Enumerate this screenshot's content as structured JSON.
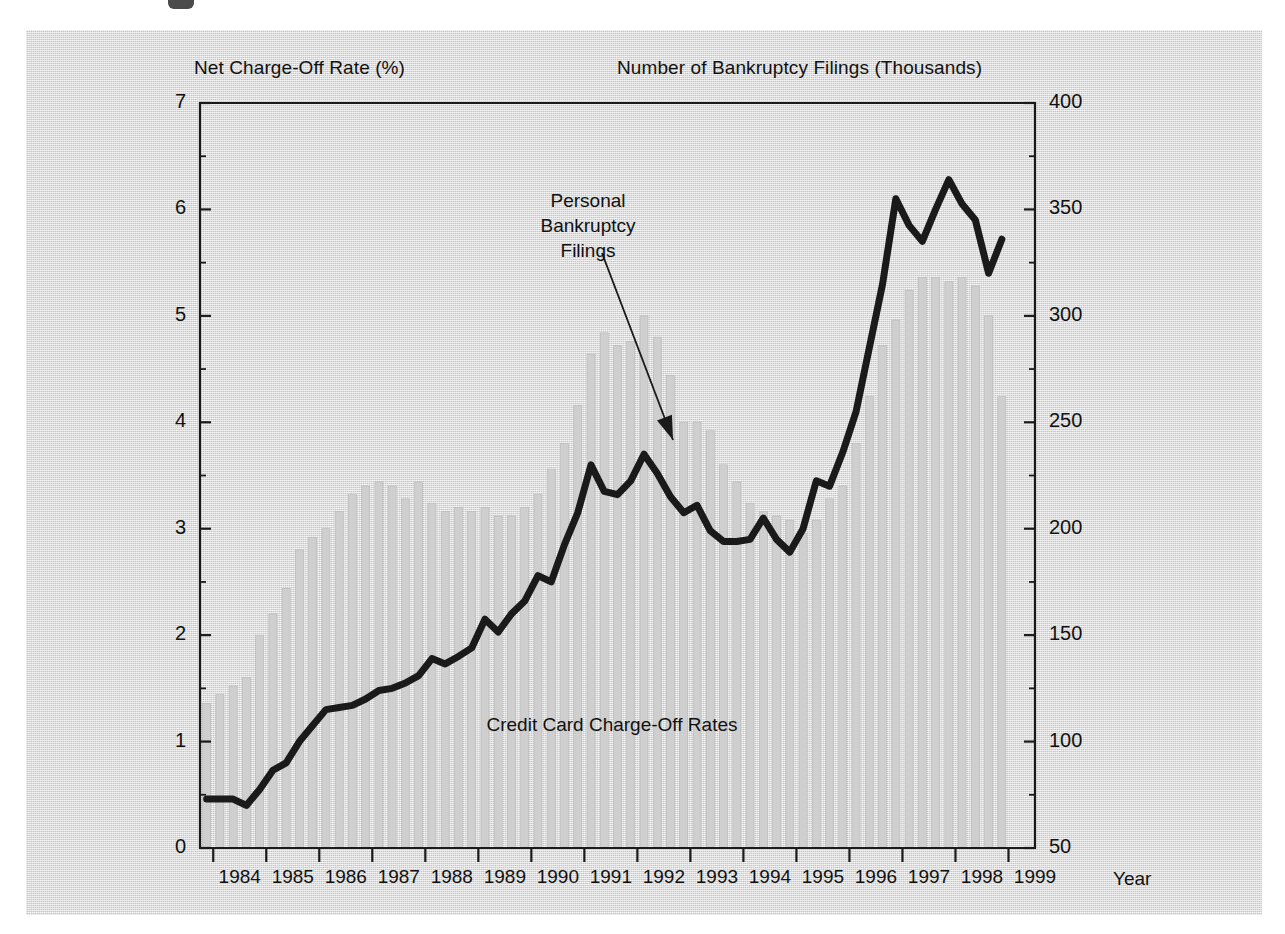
{
  "figure": {
    "background_color": "#d9d9d9",
    "left_axis_title": "Net Charge-Off Rate (%)",
    "right_axis_title": "Number of Bankruptcy Filings (Thousands)",
    "xaxis_name": "Year",
    "annotation_bankruptcy": "Personal\nBankruptcy\nFilings",
    "annotation_chargeoff": "Credit Card Charge-Off Rates",
    "line_color": "#1a1a1a",
    "bar_color": "#cfcfcf",
    "axis_color": "#1a1a1a"
  },
  "chart_data": {
    "type": "line",
    "title": "",
    "subtitle": "",
    "xlabel": "Year",
    "grid": false,
    "legend_position": "inline-annotations",
    "x_tick_labels": [
      "1984",
      "1985",
      "1986",
      "1987",
      "1988",
      "1989",
      "1990",
      "1991",
      "1992",
      "1993",
      "1994",
      "1995",
      "1996",
      "1997",
      "1998",
      "1999"
    ],
    "x_range": [
      1983.75,
      1999.5
    ],
    "axes": [
      {
        "id": "left",
        "label": "Net Charge-Off Rate (%)",
        "ylim": [
          0,
          7
        ],
        "major_ticks": [
          0,
          1,
          2,
          3,
          4,
          5,
          6,
          7
        ],
        "minor_tick_step": 0.5,
        "tick_labels": [
          "0",
          "1",
          "2",
          "3",
          "4",
          "5",
          "6",
          "7"
        ]
      },
      {
        "id": "right",
        "label": "Number of Bankruptcy Filings (Thousands)",
        "ylim": [
          50,
          400
        ],
        "major_ticks": [
          50,
          100,
          150,
          200,
          250,
          300,
          350,
          400
        ],
        "minor_tick_step": 25,
        "tick_labels": [
          "50",
          "100",
          "150",
          "200",
          "250",
          "300",
          "350",
          "400"
        ]
      }
    ],
    "series": [
      {
        "name": "Credit Card Charge-Off Rates",
        "axis": "left",
        "render": "line",
        "color": "#1a1a1a",
        "x": [
          1983.875,
          1984.125,
          1984.375,
          1984.625,
          1984.875,
          1985.125,
          1985.375,
          1985.625,
          1985.875,
          1986.125,
          1986.375,
          1986.625,
          1986.875,
          1987.125,
          1987.375,
          1987.625,
          1987.875,
          1988.125,
          1988.375,
          1988.625,
          1988.875,
          1989.125,
          1989.375,
          1989.625,
          1989.875,
          1990.125,
          1990.375,
          1990.625,
          1990.875,
          1991.125,
          1991.375,
          1991.625,
          1991.875,
          1992.125,
          1992.375,
          1992.625,
          1992.875,
          1993.125,
          1993.375,
          1993.625,
          1993.875,
          1994.125,
          1994.375,
          1994.625,
          1994.875,
          1995.125,
          1995.375,
          1995.625,
          1995.875,
          1996.125,
          1996.375,
          1996.625,
          1996.875,
          1997.125,
          1997.375,
          1997.625,
          1997.875,
          1998.125,
          1998.375,
          1998.625,
          1998.875
        ],
        "values": [
          0.46,
          0.46,
          0.46,
          0.4,
          0.55,
          0.73,
          0.8,
          1.0,
          1.15,
          1.3,
          1.32,
          1.34,
          1.4,
          1.48,
          1.5,
          1.55,
          1.62,
          1.78,
          1.73,
          1.8,
          1.88,
          2.15,
          2.03,
          2.2,
          2.32,
          2.56,
          2.5,
          2.85,
          3.15,
          3.6,
          3.35,
          3.32,
          3.45,
          3.7,
          3.52,
          3.3,
          3.15,
          3.22,
          2.98,
          2.88,
          2.88,
          2.9,
          3.1,
          2.9,
          2.78,
          3.0,
          3.45,
          3.4,
          3.72,
          4.1,
          4.7,
          5.3,
          6.1,
          5.85,
          5.7,
          6.0,
          6.28,
          6.05,
          5.9,
          5.4,
          5.72
        ]
      },
      {
        "name": "Personal Bankruptcy Filings",
        "axis": "right",
        "render": "bar",
        "color": "#cfcfcf",
        "x": [
          1983.875,
          1984.125,
          1984.375,
          1984.625,
          1984.875,
          1985.125,
          1985.375,
          1985.625,
          1985.875,
          1986.125,
          1986.375,
          1986.625,
          1986.875,
          1987.125,
          1987.375,
          1987.625,
          1987.875,
          1988.125,
          1988.375,
          1988.625,
          1988.875,
          1989.125,
          1989.375,
          1989.625,
          1989.875,
          1990.125,
          1990.375,
          1990.625,
          1990.875,
          1991.125,
          1991.375,
          1991.625,
          1991.875,
          1992.125,
          1992.375,
          1992.625,
          1992.875,
          1993.125,
          1993.375,
          1993.625,
          1993.875,
          1994.125,
          1994.375,
          1994.625,
          1994.875,
          1995.125,
          1995.375,
          1995.625,
          1995.875,
          1996.125,
          1996.375,
          1996.625,
          1996.875,
          1997.125,
          1997.375,
          1997.625,
          1997.875,
          1998.125,
          1998.375,
          1998.625,
          1998.875
        ],
        "values": [
          118,
          122,
          126,
          130,
          150,
          160,
          172,
          190,
          196,
          200,
          208,
          216,
          220,
          222,
          220,
          214,
          222,
          212,
          208,
          210,
          208,
          210,
          206,
          206,
          210,
          216,
          228,
          240,
          258,
          282,
          292,
          286,
          288,
          300,
          290,
          272,
          250,
          250,
          246,
          230,
          222,
          212,
          208,
          206,
          204,
          198,
          204,
          214,
          220,
          240,
          262,
          286,
          298,
          312,
          318,
          318,
          316,
          318,
          314,
          300,
          262
        ]
      }
    ],
    "annotations": [
      {
        "text": "Personal Bankruptcy Filings",
        "type": "arrow-label",
        "points_to_series": "Personal Bankruptcy Filings"
      },
      {
        "text": "Credit Card Charge-Off Rates",
        "type": "inline-label",
        "points_to_series": "Credit Card Charge-Off Rates"
      }
    ]
  }
}
